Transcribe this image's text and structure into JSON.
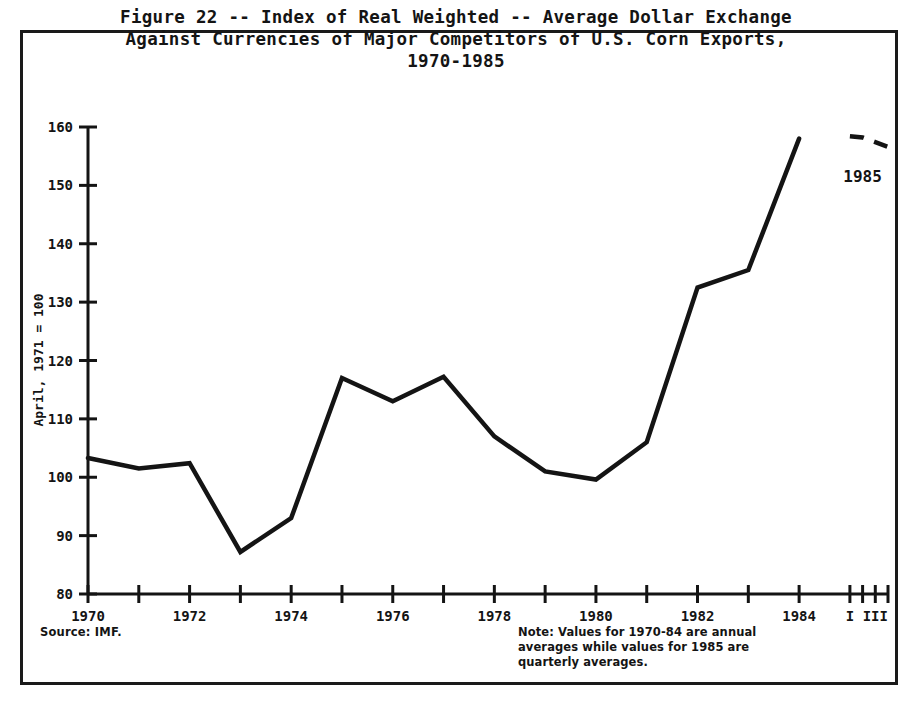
{
  "figure": {
    "title_lines": [
      "Figure 22 -- Index of Real Weighted -- Average Dollar Exchange",
      "Against Currencies of Major Competitors of U.S. Corn Exports,",
      "1970-1985"
    ],
    "source": "Source:  IMF.",
    "note_lines": [
      "Note:  Values for 1970-84 are annual",
      "averages while values for 1985 are",
      "quarterly averages."
    ],
    "series_label_1985": "1985",
    "ink_color": "#141414"
  },
  "chart_data": {
    "type": "line",
    "title": "Figure 22 -- Index of Real Weighted -- Average Dollar Exchange Against Currencies of Major Competitors of U.S. Corn Exports, 1970-1985",
    "xlabel": "",
    "ylabel": "April, 1971 = 100",
    "ylim": [
      80,
      160
    ],
    "ytick_labels": [
      "80",
      "90",
      "100",
      "110",
      "120",
      "130",
      "140",
      "150",
      "160"
    ],
    "ytick_values": [
      80,
      90,
      100,
      110,
      120,
      130,
      140,
      150,
      160
    ],
    "xtick_labels": [
      "1970",
      "1972",
      "1974",
      "1976",
      "1978",
      "1980",
      "1982",
      "1984",
      "I",
      "III"
    ],
    "xtick_values": [
      1970,
      1972,
      1974,
      1976,
      1978,
      1980,
      1982,
      1984,
      1985.0,
      1985.5
    ],
    "grid": false,
    "legend": "none",
    "series": [
      {
        "name": "Annual averages 1970-1984",
        "style": "solid",
        "x": [
          1970,
          1971,
          1972,
          1973,
          1974,
          1975,
          1976,
          1977,
          1978,
          1979,
          1980,
          1981,
          1982,
          1983,
          1984
        ],
        "values": [
          103.3,
          101.5,
          102.4,
          87.2,
          93.0,
          117.0,
          113.0,
          117.2,
          107.0,
          101.0,
          99.6,
          106.0,
          132.5,
          135.5,
          158.0
        ]
      },
      {
        "name": "1985 quarterly averages",
        "style": "dashed",
        "x": [
          1985.0,
          1985.25,
          1985.5,
          1985.75
        ],
        "values": [
          158.4,
          158.2,
          157.4,
          156.6
        ]
      }
    ],
    "annotations": [
      {
        "text": "1985",
        "x": 1985.25,
        "y": 150.5
      }
    ]
  }
}
